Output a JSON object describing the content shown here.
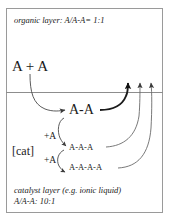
{
  "diagram": {
    "title_note": "two-phase reaction scheme",
    "organic_layer": {
      "label": "organic layer: A/A-A= 1:1"
    },
    "catalyst_layer": {
      "label": "catalyst layer (e.g. ionic liquid)",
      "ratio": "A/A-A: 10:1"
    },
    "species": {
      "reactant": "A + A",
      "dimer": "A-A",
      "trimer": "A-A-A",
      "tetramer": "A-A-A-A",
      "catalyst": "[cat]"
    },
    "additions": {
      "first": "+A",
      "second": "+A"
    },
    "colors": {
      "frame": "#9a9a9a",
      "interface": "#8d8d8d",
      "text": "#1a1a1a",
      "arrow_thin": "#4a4a4a",
      "arrow_bold": "#111111",
      "background": "#ffffff"
    }
  }
}
